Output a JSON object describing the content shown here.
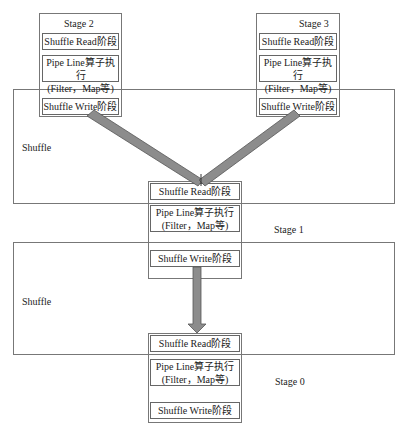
{
  "diagram": {
    "stages": [
      {
        "id": "stage2",
        "title": "Stage 2",
        "read": "Shuffle Read阶段",
        "pipe_line1": "Pipe Line算子执行",
        "pipe_line2": "(Filter，Map等)",
        "write": "Shuffle Write阶段"
      },
      {
        "id": "stage3",
        "title": "Stage 3",
        "read": "Shuffle Read阶段",
        "pipe_line1": "Pipe Line算子执行",
        "pipe_line2": "(Filter，Map等)",
        "write": "Shuffle Write阶段"
      },
      {
        "id": "stage1",
        "title": "Stage 1",
        "read": "Shuffle Read阶段",
        "pipe_line1": "Pipe Line算子执行",
        "pipe_line2": "(Filter，Map等)",
        "write": "Shuffle Write阶段"
      },
      {
        "id": "stage0",
        "title": "Stage 0",
        "read": "Shuffle Read阶段",
        "pipe_line1": "Pipe Line算子执行",
        "pipe_line2": "(Filter，Map等)",
        "write": "Shuffle Write阶段"
      }
    ],
    "shuffle_regions": [
      {
        "label": "Shuffle"
      },
      {
        "label": "Shuffle"
      }
    ],
    "colors": {
      "arrow_fill": "#8c8c8c",
      "arrow_stroke": "#555555",
      "border": "#777777"
    }
  }
}
